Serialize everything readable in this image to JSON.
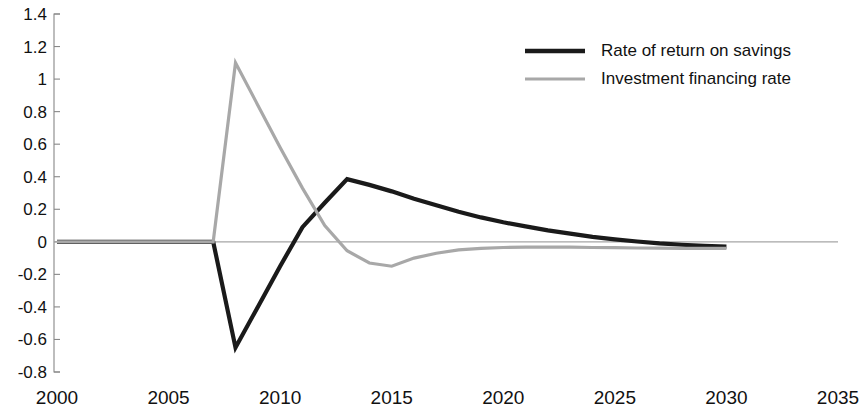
{
  "chart_data": {
    "type": "line",
    "title": "",
    "subtitle": "",
    "xlabel": "",
    "ylabel": "",
    "xlim": [
      2000,
      2035
    ],
    "ylim": [
      -0.8,
      1.4
    ],
    "grid": false,
    "legend_position": "top-right",
    "x_ticks": [
      2000,
      2005,
      2010,
      2015,
      2020,
      2025,
      2030,
      2035
    ],
    "x_tick_labels": [
      "2000",
      "2005",
      "2010",
      "2015",
      "2020",
      "2025",
      "2030",
      "2035"
    ],
    "y_ticks": [
      -0.8,
      -0.6,
      -0.4,
      -0.2,
      0,
      0.2,
      0.4,
      0.6,
      0.8,
      1,
      1.2,
      1.4
    ],
    "y_tick_labels": [
      "-0.8",
      "-0.6",
      "-0.4",
      "-0.2",
      "0",
      "0.2",
      "0.4",
      "0.6",
      "0.8",
      "1",
      "1.2",
      "1.4"
    ],
    "zero_reference_line": 0,
    "series": [
      {
        "name": "Rate of return on savings",
        "color": "#1a1a1a",
        "width": 4.2,
        "x": [
          2000,
          2001,
          2002,
          2003,
          2004,
          2005,
          2006,
          2007,
          2008,
          2009,
          2010,
          2011,
          2012,
          2013,
          2014,
          2015,
          2016,
          2017,
          2018,
          2019,
          2020,
          2021,
          2022,
          2023,
          2024,
          2025,
          2026,
          2027,
          2028,
          2029,
          2030
        ],
        "values": [
          0,
          0,
          0,
          0,
          0,
          0,
          0,
          0,
          -0.65,
          -0.4,
          -0.15,
          0.09,
          0.24,
          0.385,
          0.35,
          0.31,
          0.265,
          0.225,
          0.185,
          0.15,
          0.12,
          0.095,
          0.07,
          0.05,
          0.03,
          0.015,
          0.002,
          -0.01,
          -0.018,
          -0.025,
          -0.03
        ]
      },
      {
        "name": "Investment financing rate",
        "color": "#a8a8a8",
        "width": 3.2,
        "x": [
          2000,
          2001,
          2002,
          2003,
          2004,
          2005,
          2006,
          2007,
          2008,
          2009,
          2010,
          2011,
          2012,
          2013,
          2014,
          2015,
          2016,
          2017,
          2018,
          2019,
          2020,
          2021,
          2022,
          2023,
          2024,
          2025,
          2026,
          2027,
          2028,
          2029,
          2030
        ],
        "values": [
          0,
          0,
          0,
          0,
          0,
          0,
          0,
          0,
          1.1,
          0.84,
          0.58,
          0.33,
          0.1,
          -0.055,
          -0.13,
          -0.15,
          -0.1,
          -0.07,
          -0.05,
          -0.04,
          -0.035,
          -0.032,
          -0.032,
          -0.033,
          -0.035,
          -0.036,
          -0.038,
          -0.039,
          -0.04,
          -0.04,
          -0.04
        ]
      }
    ],
    "annotations": []
  },
  "legend": {
    "items": [
      {
        "label": "Rate of return on savings",
        "color": "#1a1a1a",
        "swatch_width": 4.5
      },
      {
        "label": "Investment financing rate",
        "color": "#a8a8a8",
        "swatch_width": 3.2
      }
    ]
  }
}
